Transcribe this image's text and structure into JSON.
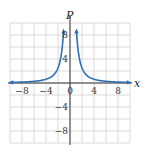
{
  "chart_data": {
    "type": "line",
    "title": "",
    "xlabel": "x",
    "ylabel": "P",
    "xlim": [
      -10,
      10
    ],
    "ylim": [
      -10,
      10
    ],
    "grid": true,
    "grid_step": 2,
    "x_tick_labels": [
      "-8",
      "-4",
      "0",
      "4",
      "8"
    ],
    "y_tick_labels": [
      "8",
      "4",
      "-4",
      "-8"
    ],
    "series": [
      {
        "name": "P = 10/x^2 (approx., estimated from shape)",
        "color": "#2f6db5",
        "x": [
          -9.5,
          -8,
          -6,
          -4,
          -3,
          -2,
          -1.5,
          -1.1,
          1.1,
          1.5,
          2,
          3,
          4,
          6,
          8,
          9.5
        ],
        "y": [
          0.11,
          0.16,
          0.28,
          0.63,
          1.11,
          2.5,
          4.44,
          8.26,
          8.26,
          4.44,
          2.5,
          1.11,
          0.63,
          0.28,
          0.16,
          0.11
        ]
      }
    ],
    "legend": "none",
    "colors": {
      "curve": "#2f6db5",
      "grid": "#d0d0d0",
      "axis": "#333333"
    }
  },
  "labels": {
    "x_axis": "x",
    "y_axis": "P",
    "ticks_x": [
      "-8",
      "-4",
      "0",
      "4",
      "8"
    ],
    "ticks_y_pos": [
      "8",
      "4"
    ],
    "ticks_y_neg": [
      "-4",
      "-8"
    ]
  }
}
